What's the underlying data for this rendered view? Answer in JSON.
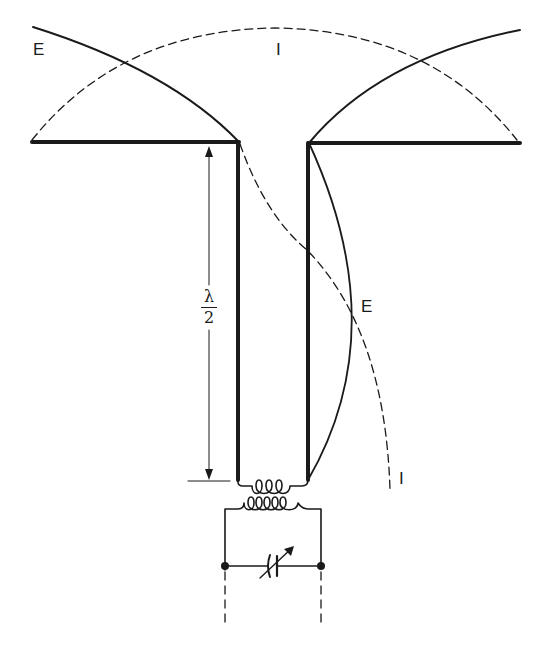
{
  "figure": {
    "labels": {
      "e_top_left": "E",
      "i_top": "I",
      "e_right": "E",
      "i_bottom_right": "I",
      "dimension_numerator": "λ",
      "dimension_denominator": "2"
    },
    "legend_semantics": {
      "solid_curve": "Voltage distribution (E)",
      "dashed_curve": "Current distribution (I)"
    },
    "colors": {
      "ink": "#1a1a1a",
      "background": "#ffffff"
    }
  }
}
